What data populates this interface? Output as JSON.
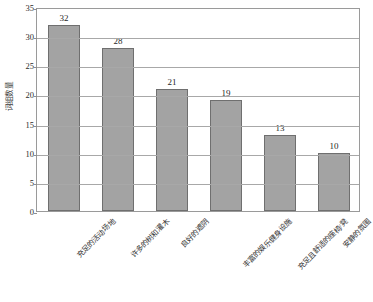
{
  "chart_data": {
    "type": "bar",
    "title": "",
    "subtitle": "",
    "xlabel": "",
    "ylabel": "词组数量",
    "categories": [
      "充足的活动场地",
      "许多的树和灌木",
      "良好的遮阴",
      "丰富的娱乐健身设施",
      "充足且舒适的座椅/凳",
      "安静的氛围"
    ],
    "values": [
      32,
      28,
      21,
      19,
      13,
      10
    ],
    "data_labels": [
      "32",
      "28",
      "21",
      "19",
      "13",
      "10"
    ],
    "ylim": [
      0,
      35
    ],
    "ytick_values": [
      0,
      5,
      10,
      15,
      20,
      25,
      30,
      35
    ],
    "ytick_labels": [
      "0",
      "5",
      "10",
      "15",
      "20",
      "25",
      "30",
      "35"
    ],
    "grid": "horizontal",
    "legend": "none",
    "bar_color": "#a3a3a3",
    "bar_border_color": "#6f6f6f",
    "plot_border_color": "#9a9a9a",
    "gridline_color": "#a8a8a8",
    "background_color": "#ffffff",
    "text_color": "#2b2b2b"
  }
}
